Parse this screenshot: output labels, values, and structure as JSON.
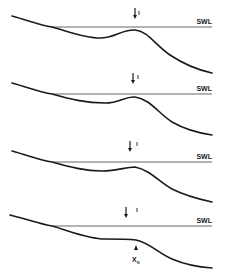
{
  "figure": {
    "swl_label": "SWL",
    "xo_label": "X",
    "xo_subscript": "o",
    "colors": {
      "line": "#1a1a1a",
      "swl": "#555555",
      "background": "#ffffff"
    },
    "panels": [
      {
        "id": 1,
        "offset_y": 0,
        "swl_y": 27,
        "profile_path": "M12,16 C30,21 40,25 52,27 C70,32 85,38 100,38 C115,38 122,29 135,30 C148,31 155,45 170,55 C185,65 198,70 212,73",
        "arrow_x": 135,
        "arrow_y1": 8,
        "arrow_y2": 19,
        "tick_x": 139,
        "tick_y1": 11,
        "tick_y2": 15
      },
      {
        "id": 2,
        "offset_y": 67,
        "swl_y": 27,
        "profile_path": "M12,16 C30,21 40,25 52,27 C70,32 85,36 105,36 C120,36 125,29 135,30 C150,32 158,46 172,55 C186,63 198,66 212,68",
        "arrow_x": 133,
        "arrow_y1": 6,
        "arrow_y2": 17,
        "tick_x": 138,
        "tick_y1": 8,
        "tick_y2": 12
      },
      {
        "id": 3,
        "offset_y": 133,
        "swl_y": 29,
        "profile_path": "M12,18 C30,23 40,27 52,29 C70,34 85,38 102,38 C118,38 125,34 135,34 C150,37 158,48 172,56 C186,63 198,66 212,69",
        "arrow_x": 130,
        "arrow_y1": 8,
        "arrow_y2": 19,
        "tick_x": 137,
        "tick_y1": 9,
        "tick_y2": 13
      },
      {
        "id": 4,
        "offset_y": 199,
        "swl_y": 27,
        "profile_path": "M10,16 C30,21 40,25 52,27 C70,32 88,40 105,40 C120,40 128,40 136,41 C150,44 158,54 172,60 C186,66 198,68 212,69",
        "arrow_x": 126,
        "arrow_y1": 8,
        "arrow_y2": 19,
        "tick_x": 137,
        "tick_y1": 9,
        "tick_y2": 13,
        "xo_marker": {
          "x": 136,
          "y_tip": 46,
          "label_y": 63
        }
      }
    ]
  }
}
